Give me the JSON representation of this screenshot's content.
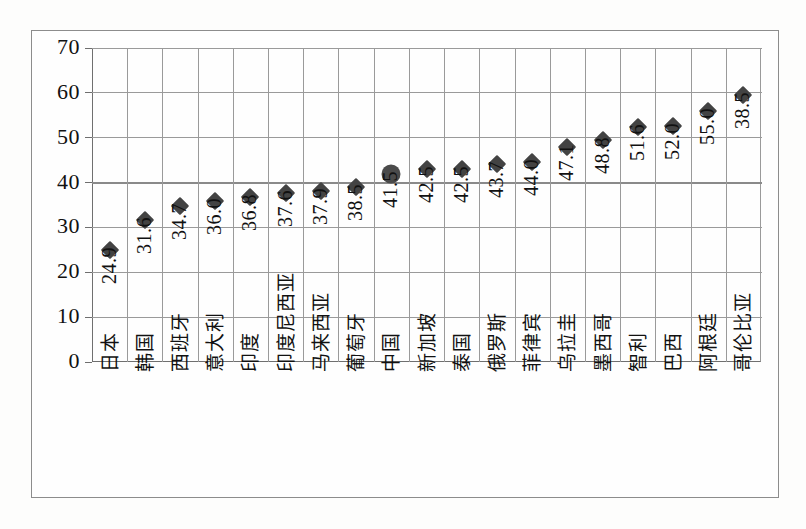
{
  "figure": {
    "background_color": "#fdfdfc",
    "frame_color": "#8c8c8c",
    "plot_line_color": "#9a9a9a",
    "marker_color": "#434343",
    "highlight_marker_color": "#4a4a4a"
  },
  "chart_data": {
    "type": "scatter",
    "title": "",
    "xlabel": "",
    "ylabel": "",
    "ylim": [
      0,
      70
    ],
    "yticks": [
      "0",
      "10",
      "20",
      "30",
      "40",
      "50",
      "60",
      "70"
    ],
    "grid": true,
    "grid_emphasis_value": 40,
    "legend": null,
    "categories": [
      "日本",
      "韩国",
      "西班牙",
      "意大利",
      "印度",
      "印度尼西亚",
      "马来西亚",
      "葡萄牙",
      "中国",
      "新加坡",
      "泰国",
      "俄罗斯",
      "菲律宾",
      "乌拉圭",
      "墨西哥",
      "智利",
      "巴西",
      "阿根廷",
      "哥伦比亚"
    ],
    "data_labels": [
      "24.9",
      "31.6",
      "34.7",
      "36.0",
      "36.8",
      "37.6",
      "37.9",
      "38.5",
      "41.5",
      "42.5",
      "42.5",
      "43.7",
      "44.0",
      "47.1",
      "48.8",
      "51.6",
      "52.0",
      "55.0",
      "38.5"
    ],
    "values": [
      24.9,
      31.6,
      34.7,
      36.0,
      36.8,
      37.6,
      37.9,
      38.5,
      41.5,
      42.5,
      42.5,
      43.7,
      44.0,
      47.1,
      48.8,
      51.6,
      52.0,
      55.0,
      38.5
    ],
    "plotted_values": [
      24.9,
      31.6,
      34.7,
      36.0,
      36.8,
      37.6,
      38.2,
      39.0,
      42.0,
      43.0,
      43.0,
      44.2,
      44.6,
      48.0,
      49.6,
      52.3,
      52.7,
      56.0,
      59.5
    ],
    "marker_styles": [
      "diamond",
      "diamond",
      "diamond",
      "diamond",
      "diamond",
      "diamond",
      "diamond",
      "diamond",
      "circle",
      "diamond",
      "diamond",
      "diamond",
      "diamond",
      "diamond",
      "diamond",
      "diamond",
      "diamond",
      "diamond",
      "diamond"
    ],
    "highlighted_category": "中国"
  }
}
